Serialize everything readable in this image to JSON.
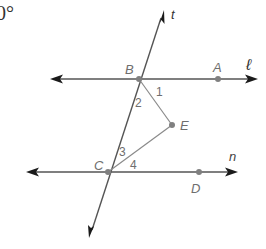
{
  "diagram": {
    "type": "geometry-parallel-lines-transversal",
    "fragment_text": "0°",
    "lines": {
      "l": {
        "label": "ℓ"
      },
      "n": {
        "label": "n"
      },
      "t": {
        "label": "t"
      }
    },
    "points": {
      "A": {
        "label": "A"
      },
      "B": {
        "label": "B"
      },
      "C": {
        "label": "C"
      },
      "D": {
        "label": "D"
      },
      "E": {
        "label": "E"
      }
    },
    "angles": {
      "a1": {
        "label": "1"
      },
      "a2": {
        "label": "2"
      },
      "a3": {
        "label": "3"
      },
      "a4": {
        "label": "4"
      }
    },
    "segments": [
      "BE",
      "CE"
    ]
  }
}
